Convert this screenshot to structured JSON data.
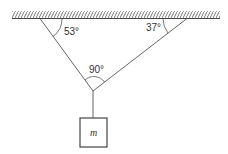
{
  "diagram": {
    "type": "physics-free-body",
    "angles": {
      "left_rope_to_ceiling": "53°",
      "right_rope_to_ceiling": "37°",
      "between_ropes": "90°"
    },
    "mass_label": "m",
    "colors": {
      "stroke": "#444444",
      "background": "#ffffff"
    }
  }
}
